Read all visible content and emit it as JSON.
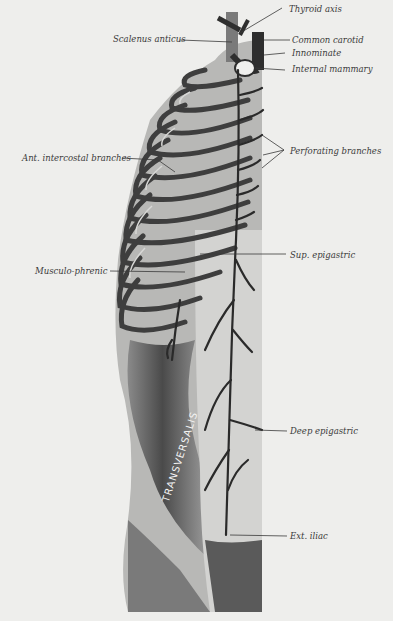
{
  "figure": {
    "type": "anatomical illustration",
    "background": "#eeeeec",
    "ink": "#3a3a3a"
  },
  "labels": {
    "thyroid_axis": "Thyroid axis",
    "scalenus_anticus": "Scalenus anticus",
    "common_carotid": "Common carotid",
    "innominate": "Innominate",
    "internal_mammary": "Internal mammary",
    "ant_intercostal": "Ant. intercostal branches",
    "perforating": "Perforating branches",
    "sup_epigastric": "Sup. epigastric",
    "musculo_phrenic": "Musculo-phrenic",
    "deep_epigastric": "Deep epigastric",
    "ext_iliac": "Ext. iliac",
    "transversalis": "TRANSVERSALIS"
  }
}
